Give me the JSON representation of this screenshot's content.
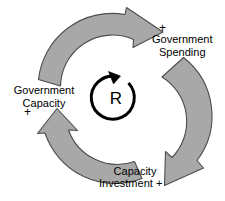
{
  "diagram": {
    "type": "causal-loop-diagram",
    "loop_marker": {
      "symbol": "R",
      "meaning": "reinforcing-loop",
      "direction": "counterclockwise"
    },
    "colors": {
      "arrow_fill": "#a8a8a8",
      "arrow_stroke": "#4d4d4d",
      "text": "#000000",
      "background": "#ffffff"
    },
    "nodes": [
      {
        "id": "government-spending",
        "line1": "Government",
        "line2": "Spending",
        "polarity": "+",
        "polarity_position": "above"
      },
      {
        "id": "government-capacity",
        "line1": "Government",
        "line2": "Capacity",
        "polarity": "+",
        "polarity_position": "below"
      },
      {
        "id": "capacity-investment",
        "line1": "Capacity",
        "line2": "Investment",
        "polarity": "+",
        "polarity_position": "inline-after"
      }
    ],
    "arrows": [
      {
        "id": "arrow-top",
        "from": "government-capacity",
        "to": "government-spending"
      },
      {
        "id": "arrow-right",
        "from": "government-spending",
        "to": "capacity-investment"
      },
      {
        "id": "arrow-bottom-left",
        "from": "capacity-investment",
        "to": "government-capacity"
      }
    ]
  }
}
